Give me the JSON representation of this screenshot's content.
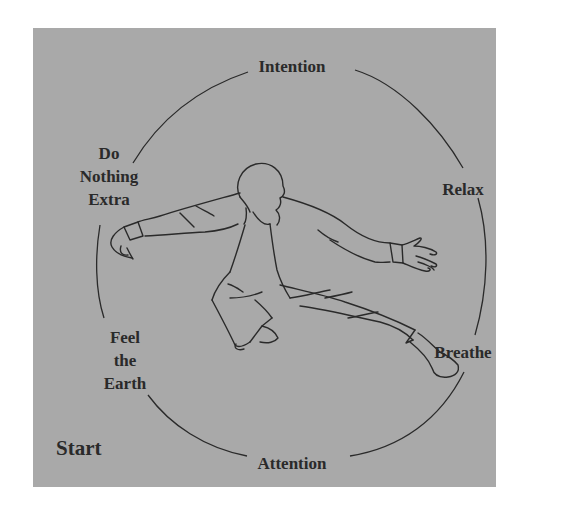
{
  "diagram": {
    "background_color": "#a9a9a9",
    "line_color": "#2a2a2a",
    "center_figure": "tai-chi-practitioner-in-low-stance",
    "cycle_labels": {
      "top": "Intention",
      "right_upper": "Relax",
      "right_lower": "Breathe",
      "bottom": "Attention",
      "left_lower": [
        "Feel",
        "the",
        "Earth"
      ],
      "left_upper": [
        "Do",
        "Nothing",
        "Extra"
      ]
    },
    "start_label": "Start"
  }
}
